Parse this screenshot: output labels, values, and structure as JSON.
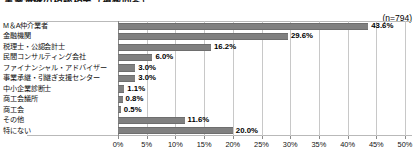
{
  "chart": {
    "title": "事業承継の相談相手（複数回答）",
    "sample_size_label": "(n=794)"
  },
  "chart_data": {
    "type": "bar",
    "orientation": "horizontal",
    "title": "事業承継の相談相手（複数回答）",
    "subtitle": "(n=794)",
    "xlabel": "",
    "ylabel": "",
    "xlim": [
      0,
      50
    ],
    "xticks": [
      0,
      5,
      10,
      15,
      20,
      25,
      30,
      35,
      40,
      45,
      50
    ],
    "xticklabels": [
      "0%",
      "5%",
      "10%",
      "15%",
      "20%",
      "25%",
      "30%",
      "35%",
      "40%",
      "45%",
      "50%"
    ],
    "grid": true,
    "legend": false,
    "bar_color": "#808080",
    "categories": [
      "M＆A仲介業者",
      "金融機関",
      "税理士・公認会計士",
      "民間コンサルティング会社",
      "ファイナンシャル・アドバイザー",
      "事業承継・引継ぎ支援センター",
      "中小企業診断士",
      "商工会議所",
      "商工会",
      "その他",
      "特にない"
    ],
    "values": [
      43.6,
      29.6,
      16.2,
      6.0,
      3.0,
      3.0,
      1.1,
      0.8,
      0.5,
      11.6,
      20.0
    ],
    "data_labels": [
      "43.6%",
      "29.6%",
      "16.2%",
      "6.0%",
      "3.0%",
      "3.0%",
      "1.1%",
      "0.8%",
      "0.5%",
      "11.6%",
      "20.0%"
    ]
  }
}
